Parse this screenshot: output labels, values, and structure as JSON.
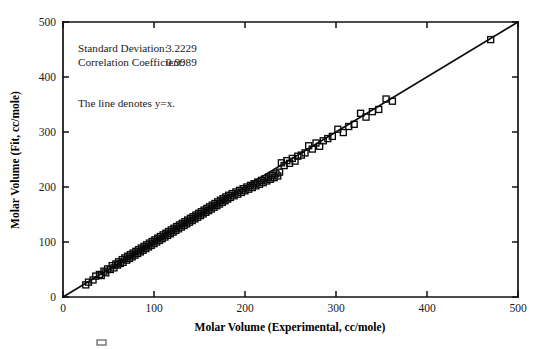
{
  "figure": {
    "background_color": "#ffffff",
    "ink_color": "#0a0a0a",
    "annotations": {
      "std_dev_label": "Standard Deviation:",
      "std_dev_value": "3.2229",
      "corr_label": "Correlation Coefficient:",
      "corr_value": "0.9989",
      "line_note": "The line denotes y=x."
    }
  },
  "chart_data": {
    "type": "scatter",
    "title": "",
    "xlabel": "Molar Volume (Experimental, cc/mole)",
    "ylabel": "Molar Volume (Fit, cc/mole)",
    "xlim": [
      0,
      500
    ],
    "ylim": [
      0,
      500
    ],
    "xticks": [
      0,
      100,
      200,
      300,
      400,
      500
    ],
    "yticks": [
      0,
      100,
      200,
      300,
      400,
      500
    ],
    "xtick_labels": [
      "0",
      "100",
      "200",
      "300",
      "400",
      "500"
    ],
    "ytick_labels": [
      "0",
      "100",
      "200",
      "300",
      "400",
      "500"
    ],
    "grid": false,
    "legend": false,
    "marker": "open-square",
    "marker_size": 6,
    "annotations": [
      {
        "text": "Standard Deviation:   3.2229",
        "x": 55,
        "y": 455
      },
      {
        "text": "Correlation Coefficient: 0.9989",
        "x": 55,
        "y": 435
      },
      {
        "text": "The line denotes y=x.",
        "x": 55,
        "y": 385
      }
    ],
    "reference_line": {
      "label": "y = x",
      "slope": 1,
      "intercept": 0,
      "x_from": 0,
      "x_to": 500
    },
    "statistics": {
      "standard_deviation": 3.2229,
      "correlation_coefficient": 0.9989
    },
    "series": [
      {
        "name": "Molar volume fit vs experimental",
        "points": [
          [
            25,
            22
          ],
          [
            28,
            27
          ],
          [
            33,
            31
          ],
          [
            36,
            38
          ],
          [
            40,
            41
          ],
          [
            42,
            39
          ],
          [
            45,
            47
          ],
          [
            47,
            44
          ],
          [
            49,
            51
          ],
          [
            52,
            50
          ],
          [
            54,
            57
          ],
          [
            56,
            53
          ],
          [
            58,
            60
          ],
          [
            60,
            58
          ],
          [
            61,
            64
          ],
          [
            63,
            61
          ],
          [
            65,
            68
          ],
          [
            66,
            63
          ],
          [
            68,
            71
          ],
          [
            70,
            67
          ],
          [
            71,
            74
          ],
          [
            73,
            70
          ],
          [
            74,
            77
          ],
          [
            76,
            73
          ],
          [
            77,
            80
          ],
          [
            79,
            76
          ],
          [
            80,
            83
          ],
          [
            82,
            79
          ],
          [
            83,
            86
          ],
          [
            85,
            82
          ],
          [
            86,
            89
          ],
          [
            88,
            85
          ],
          [
            89,
            92
          ],
          [
            91,
            88
          ],
          [
            92,
            95
          ],
          [
            94,
            91
          ],
          [
            95,
            98
          ],
          [
            97,
            94
          ],
          [
            98,
            101
          ],
          [
            100,
            97
          ],
          [
            101,
            104
          ],
          [
            103,
            100
          ],
          [
            104,
            107
          ],
          [
            106,
            103
          ],
          [
            107,
            110
          ],
          [
            109,
            106
          ],
          [
            110,
            113
          ],
          [
            112,
            109
          ],
          [
            113,
            116
          ],
          [
            115,
            112
          ],
          [
            116,
            119
          ],
          [
            118,
            115
          ],
          [
            119,
            122
          ],
          [
            121,
            118
          ],
          [
            122,
            125
          ],
          [
            124,
            121
          ],
          [
            125,
            128
          ],
          [
            127,
            124
          ],
          [
            128,
            131
          ],
          [
            130,
            127
          ],
          [
            131,
            134
          ],
          [
            133,
            130
          ],
          [
            134,
            137
          ],
          [
            136,
            133
          ],
          [
            137,
            140
          ],
          [
            139,
            136
          ],
          [
            140,
            143
          ],
          [
            142,
            139
          ],
          [
            143,
            146
          ],
          [
            145,
            142
          ],
          [
            146,
            149
          ],
          [
            148,
            145
          ],
          [
            149,
            152
          ],
          [
            151,
            148
          ],
          [
            152,
            155
          ],
          [
            154,
            151
          ],
          [
            155,
            158
          ],
          [
            157,
            154
          ],
          [
            158,
            161
          ],
          [
            160,
            157
          ],
          [
            161,
            164
          ],
          [
            163,
            160
          ],
          [
            164,
            167
          ],
          [
            166,
            163
          ],
          [
            167,
            170
          ],
          [
            169,
            166
          ],
          [
            170,
            173
          ],
          [
            172,
            169
          ],
          [
            173,
            176
          ],
          [
            175,
            172
          ],
          [
            176,
            179
          ],
          [
            178,
            175
          ],
          [
            179,
            182
          ],
          [
            181,
            178
          ],
          [
            182,
            185
          ],
          [
            184,
            181
          ],
          [
            186,
            188
          ],
          [
            188,
            184
          ],
          [
            190,
            191
          ],
          [
            192,
            187
          ],
          [
            194,
            194
          ],
          [
            196,
            190
          ],
          [
            198,
            197
          ],
          [
            200,
            193
          ],
          [
            202,
            200
          ],
          [
            204,
            196
          ],
          [
            206,
            203
          ],
          [
            208,
            199
          ],
          [
            210,
            206
          ],
          [
            212,
            202
          ],
          [
            214,
            209
          ],
          [
            216,
            205
          ],
          [
            218,
            212
          ],
          [
            220,
            208
          ],
          [
            222,
            215
          ],
          [
            224,
            211
          ],
          [
            226,
            218
          ],
          [
            228,
            214
          ],
          [
            230,
            221
          ],
          [
            232,
            217
          ],
          [
            234,
            224
          ],
          [
            236,
            220
          ],
          [
            238,
            227
          ],
          [
            240,
            244
          ],
          [
            243,
            239
          ],
          [
            246,
            248
          ],
          [
            249,
            243
          ],
          [
            252,
            252
          ],
          [
            255,
            247
          ],
          [
            258,
            256
          ],
          [
            262,
            258
          ],
          [
            266,
            262
          ],
          [
            270,
            275
          ],
          [
            274,
            269
          ],
          [
            278,
            280
          ],
          [
            282,
            274
          ],
          [
            286,
            284
          ],
          [
            291,
            288
          ],
          [
            296,
            292
          ],
          [
            302,
            305
          ],
          [
            308,
            299
          ],
          [
            314,
            310
          ],
          [
            320,
            314
          ],
          [
            327,
            334
          ],
          [
            333,
            327
          ],
          [
            340,
            337
          ],
          [
            347,
            341
          ],
          [
            355,
            360
          ],
          [
            362,
            356
          ],
          [
            470,
            468
          ]
        ]
      }
    ]
  }
}
